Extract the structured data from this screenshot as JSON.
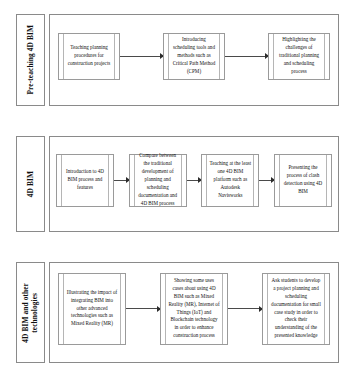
{
  "diagram": {
    "type": "flowchart",
    "colors": {
      "box_border": "#9a9a9a",
      "frame_border": "#8a8a8a",
      "arrow": "#2b2b2b",
      "background": "#ffffff",
      "text": "#111111"
    },
    "bands": [
      {
        "label": "Pre-teaching 4D BIM",
        "steps": [
          "Teaching planning procedures for construction projects",
          "Introducing scheduling tools and methods such as Critical Path Method (CPM)",
          "Highlighting the challenges of traditional planning and scheduling process"
        ]
      },
      {
        "label": "4D BIM",
        "steps": [
          "Introduction to 4D BIM process and features",
          "Compare between the traditional development of planning and scheduling documentation and 4D BIM process",
          "Teaching at the least one 4D BIM platform such as Autodesk Navisworks",
          "Presenting the process of clash detection using 4D BIM"
        ]
      },
      {
        "label": "4D BIM and other\ntechnologies",
        "steps": [
          "Illustrating the impact of integrating BIM into other advanced technologies such as Mixed Reality (MR)",
          "Showing some uses cases about using 4D BIM such as Mixed Reality (MR), Internet of Things (IoT) and Blockchain technology in order to enhance construction process",
          "Ask students to develop a project planning and scheduling documentation for small case study in order to check their understanding of the presented knowledge"
        ]
      }
    ]
  }
}
